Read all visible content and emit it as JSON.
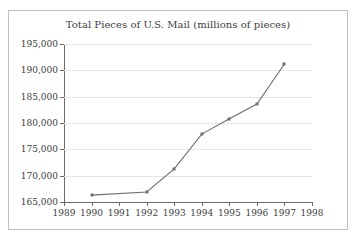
{
  "chart_data": {
    "type": "line",
    "title": "Total Pieces of U.S. Mail (millions of pieces)",
    "xlabel": "",
    "ylabel": "",
    "x": [
      1990,
      1992,
      1993,
      1994,
      1995,
      1996,
      1997
    ],
    "values": [
      166300,
      166900,
      171300,
      177900,
      180800,
      183600,
      191200
    ],
    "series": [
      {
        "name": "Total Pieces of U.S. Mail",
        "x": [
          1990,
          1992,
          1993,
          1994,
          1995,
          1996,
          1997
        ],
        "values": [
          166300,
          166900,
          171300,
          177900,
          180800,
          183600,
          191200
        ]
      }
    ],
    "xlim": [
      1989,
      1998
    ],
    "ylim": [
      165000,
      195000
    ],
    "xticks": [
      1989,
      1990,
      1991,
      1992,
      1993,
      1994,
      1995,
      1996,
      1997,
      1998
    ],
    "xtick_labels": [
      "1989",
      "1990",
      "1991",
      "1992",
      "1993",
      "1994",
      "1995",
      "1996",
      "1997",
      "1998"
    ],
    "yticks": [
      165000,
      170000,
      175000,
      180000,
      185000,
      190000,
      195000
    ],
    "ytick_labels": [
      "165,000",
      "170,000",
      "175,000",
      "180,000",
      "185,000",
      "190,000",
      "195,000"
    ],
    "grid": true,
    "grid_axis": "y",
    "legend": false,
    "legend_position": "none",
    "marker": "square",
    "line_color": "#6e6e6e",
    "marker_color": "#6e6e6e",
    "grid_color": "#e6e6e6",
    "axis_color": "#6b6b6b",
    "text_color": "#3d3d3d",
    "background_color": "#ffffff",
    "border_color": "#bfbfbf"
  }
}
